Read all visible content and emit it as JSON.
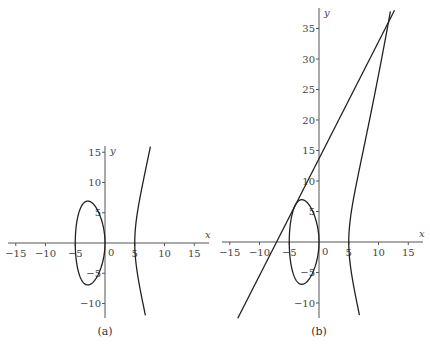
{
  "chart_data": [
    {
      "type": "line",
      "panel_label": "(a)",
      "title": "",
      "xlabel": "x",
      "ylabel": "y",
      "curve": "y^2 = x^3 - 25x",
      "xticks": [
        "-15",
        "-10",
        "-5",
        "0",
        "5",
        "10",
        "15"
      ],
      "yticks": [
        "-10",
        "-5",
        "5",
        "10",
        "15"
      ],
      "xlim": [
        -16.5,
        17.5
      ],
      "ylim": [
        -12.5,
        16.5
      ],
      "grid": false,
      "series": [
        {
          "name": "bounded component (egg)",
          "x_range": [
            -5,
            0
          ],
          "y_max": 6.94,
          "y_min": -6.94
        },
        {
          "name": "unbounded branch",
          "x_start": 5
        }
      ]
    },
    {
      "type": "line",
      "panel_label": "(b)",
      "title": "",
      "xlabel": "x",
      "ylabel": "y",
      "curve": "y^2 = x^3 - 25x",
      "xticks": [
        "-15",
        "-10",
        "-5",
        "0",
        "5",
        "10",
        "15"
      ],
      "yticks": [
        "-10",
        "-5",
        "5",
        "10",
        "15",
        "20",
        "25",
        "30",
        "35"
      ],
      "xlim": [
        -16.5,
        17.5
      ],
      "ylim": [
        -12.5,
        38
      ],
      "grid": false,
      "series": [
        {
          "name": "elliptic curve",
          "x_range_egg": [
            -5,
            0
          ],
          "x_start_branch": 5
        },
        {
          "name": "tangent line at (-4, 6)",
          "slope": 1.9167,
          "intercept": 13.667,
          "tangent_point": [
            -4,
            6
          ],
          "intersection_point": [
            11.67,
            36.04
          ]
        }
      ]
    }
  ],
  "labels": {
    "a": {
      "caption": "(a)",
      "x": "x",
      "y": "y",
      "origin": "0"
    },
    "b": {
      "caption": "(b)",
      "x": "x",
      "y": "y",
      "origin": "0"
    }
  }
}
